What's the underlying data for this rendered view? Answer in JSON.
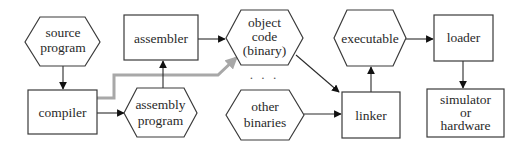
{
  "diagram": {
    "type": "flowchart",
    "title": "",
    "nodes": [
      {
        "id": "source_program",
        "shape": "hexagon",
        "lines": [
          "source",
          "program"
        ]
      },
      {
        "id": "compiler",
        "shape": "rectangle",
        "lines": [
          "compiler"
        ]
      },
      {
        "id": "assembler",
        "shape": "rectangle",
        "lines": [
          "assembler"
        ]
      },
      {
        "id": "assembly_program",
        "shape": "hexagon",
        "lines": [
          "assembly",
          "program"
        ]
      },
      {
        "id": "object_code",
        "shape": "hexagon",
        "lines": [
          "object",
          "code",
          "(binary)"
        ]
      },
      {
        "id": "ellipsis",
        "shape": "text",
        "lines": [
          "· · ·"
        ]
      },
      {
        "id": "other_binaries",
        "shape": "hexagon",
        "lines": [
          "other",
          "binaries"
        ]
      },
      {
        "id": "executable",
        "shape": "hexagon",
        "lines": [
          "executable"
        ]
      },
      {
        "id": "linker",
        "shape": "rectangle",
        "lines": [
          "linker"
        ]
      },
      {
        "id": "loader",
        "shape": "rectangle",
        "lines": [
          "loader"
        ]
      },
      {
        "id": "simulator_hardware",
        "shape": "rectangle",
        "lines": [
          "simulator",
          "or",
          "hardware"
        ]
      }
    ],
    "edges": [
      {
        "from": "source_program",
        "to": "compiler",
        "style": "solid-black"
      },
      {
        "from": "compiler",
        "to": "assembly_program",
        "style": "solid-black"
      },
      {
        "from": "assembly_program",
        "to": "assembler",
        "style": "solid-black"
      },
      {
        "from": "assembler",
        "to": "object_code",
        "style": "solid-black"
      },
      {
        "from": "compiler",
        "to": "object_code",
        "style": "thick-grey"
      },
      {
        "from": "object_code",
        "to": "linker",
        "style": "solid-black"
      },
      {
        "from": "other_binaries",
        "to": "linker",
        "style": "solid-black"
      },
      {
        "from": "linker",
        "to": "executable",
        "style": "solid-black"
      },
      {
        "from": "executable",
        "to": "loader",
        "style": "solid-black"
      },
      {
        "from": "loader",
        "to": "simulator_hardware",
        "style": "solid-black"
      }
    ],
    "colors": {
      "stroke": "#3a3a3a",
      "text": "#2a2a2a",
      "grey_path": "#a8a8a8",
      "background": "#ffffff"
    }
  }
}
